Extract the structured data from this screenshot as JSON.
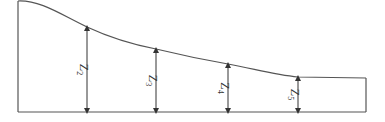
{
  "diagram": {
    "type": "water-surface-profile",
    "colors": {
      "stroke": "#555555",
      "arrow": "#333333",
      "background": "#ffffff"
    },
    "outline": {
      "left_wall": {
        "x": 18,
        "y_top": 1,
        "y_bottom": 112
      },
      "bed": {
        "y": 112,
        "x_start": 18,
        "x_end": 366
      },
      "right_wall": {
        "x": 366,
        "y_top": 78,
        "y_bottom": 112
      },
      "surface_curve": "M18,1 C40,0 60,14 87,27 C115,40 135,45 156,49 C185,56 205,60 228,64 C255,69 275,75 298,77 L366,78"
    },
    "depths": [
      {
        "label": "Z",
        "sub": "2",
        "x": 87,
        "y_top": 27,
        "y_bottom": 112
      },
      {
        "label": "Z",
        "sub": "3",
        "x": 156,
        "y_top": 49,
        "y_bottom": 112
      },
      {
        "label": "Z",
        "sub": "4",
        "x": 228,
        "y_top": 64,
        "y_bottom": 112
      },
      {
        "label": "Z",
        "sub": "5",
        "x": 298,
        "y_top": 77,
        "y_bottom": 112
      }
    ]
  }
}
